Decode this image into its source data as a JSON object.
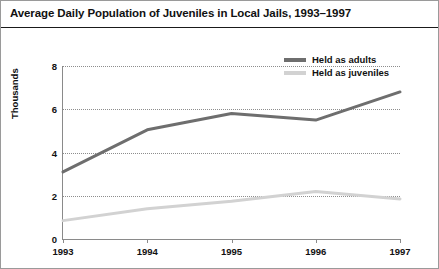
{
  "chart_data": {
    "type": "line",
    "title": "Average Daily Population of Juveniles in Local Jails, 1993–1997",
    "xlabel": "",
    "ylabel": "Thousands",
    "x": [
      "1993",
      "1994",
      "1995",
      "1996",
      "1997"
    ],
    "categories": [
      "1993",
      "1994",
      "1995",
      "1996",
      "1997"
    ],
    "series": [
      {
        "name": "Held as adults",
        "color": "#6e6e6e",
        "values": [
          3.1,
          5.05,
          5.8,
          5.5,
          6.8
        ]
      },
      {
        "name": "Held as juveniles",
        "color": "#d2d2d2",
        "values": [
          0.85,
          1.4,
          1.75,
          2.2,
          1.85
        ]
      }
    ],
    "ylim": [
      0,
      8
    ],
    "yticks": [
      0,
      2,
      4,
      6,
      8
    ],
    "ytick_labels": [
      "0",
      "2",
      "4",
      "6",
      "8"
    ],
    "xtick_labels": [
      "1993",
      "1994",
      "1995",
      "1996",
      "1997"
    ],
    "grid": true,
    "grid_axis": "y",
    "grid_style": "dotted",
    "legend_position": "top-right",
    "legend": [
      "Held as adults",
      "Held as juveniles"
    ]
  },
  "colors": {
    "adults_line": "#6e6e6e",
    "juveniles_line": "#d2d2d2",
    "axis": "#8a8a8a",
    "gridline": "#8d8d8d",
    "title_rule": "#1a1a1a",
    "frame": "#9a9a9a",
    "text": "#111111",
    "background": "#ffffff"
  }
}
